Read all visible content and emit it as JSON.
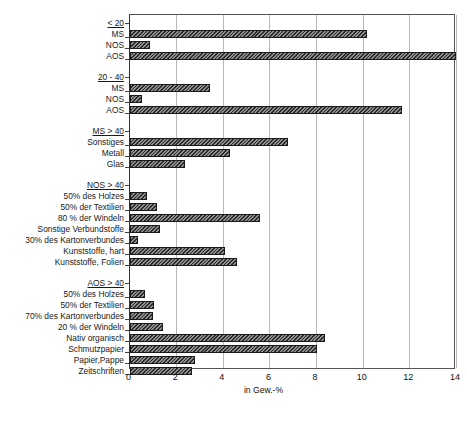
{
  "chart_data": {
    "type": "bar",
    "orientation": "horizontal",
    "title": "",
    "xlabel": "in Gew.-%",
    "ylabel": "",
    "xlim": [
      0,
      14
    ],
    "xticks": [
      0,
      2,
      4,
      6,
      8,
      10,
      12,
      14
    ],
    "xticklabels": [
      "0",
      "2",
      "4",
      "6",
      "8",
      "10",
      "12",
      "14"
    ],
    "grid": true,
    "legend": null,
    "groups": [
      {
        "header": "< 20",
        "categories": [
          "MS",
          "NOS",
          "AOS"
        ],
        "values": [
          10.2,
          0.9,
          14.0
        ]
      },
      {
        "header": "20 - 40",
        "categories": [
          "MS",
          "NOS",
          "AOS"
        ],
        "values": [
          3.45,
          0.55,
          11.7
        ]
      },
      {
        "header": "MS > 40",
        "categories": [
          "Sonstiges",
          "Metall",
          "Glas"
        ],
        "values": [
          6.8,
          4.3,
          2.4
        ]
      },
      {
        "header": "NOS > 40",
        "categories": [
          "50% des Holzes",
          "50% der Textilien",
          "80 % der Windeln",
          "Sonstige Verbundstoffe",
          "30% des Kartonverbundes",
          "Kunststoffe, hart",
          "Kunststoffe, Folien"
        ],
        "values": [
          0.75,
          1.2,
          5.6,
          1.3,
          0.35,
          4.1,
          4.6
        ]
      },
      {
        "header": "AOS > 40",
        "categories": [
          "50% des Holzes",
          "50% der Textilien",
          "70% des Kartonverbundes",
          "20 % der Windeln",
          "Nativ organisch",
          "Schmutzpapier",
          "Papier,Pappe",
          "Zeitschriften"
        ],
        "values": [
          0.65,
          1.05,
          1.0,
          1.45,
          8.4,
          8.05,
          2.8,
          2.7
        ]
      }
    ],
    "colors": {
      "bar_fill": "#4a4a4a",
      "bar_edge": "#1a1a1a",
      "grid": "#b9b9b9",
      "axis": "#555555",
      "text": "#111111"
    }
  },
  "footer": {
    "note": ""
  }
}
